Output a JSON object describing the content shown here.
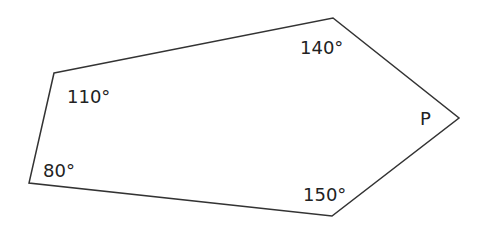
{
  "diagram": {
    "type": "pentagon",
    "stroke_color": "#333333",
    "vertices": [
      {
        "id": "top-left",
        "x": 54,
        "y": 73,
        "angle_label": "110°"
      },
      {
        "id": "top-right",
        "x": 333,
        "y": 18,
        "angle_label": "140°"
      },
      {
        "id": "right",
        "x": 459,
        "y": 118,
        "angle_label": "P"
      },
      {
        "id": "bottom-right",
        "x": 332,
        "y": 216,
        "angle_label": "150°"
      },
      {
        "id": "bottom-left",
        "x": 29,
        "y": 183,
        "angle_label": "80°"
      }
    ],
    "labels": {
      "top_left": "110°",
      "top_right": "140°",
      "right": "P",
      "bottom_right": "150°",
      "bottom_left": "80°"
    }
  }
}
